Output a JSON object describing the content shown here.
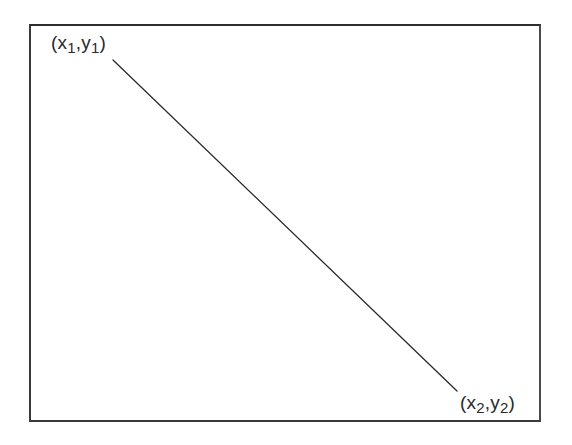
{
  "diagram": {
    "type": "line-segment",
    "frame": {
      "stroke": "#3a3a3a"
    },
    "line": {
      "stroke": "#2a2a2a",
      "start": {
        "x": 113,
        "y": 60
      },
      "end": {
        "x": 457,
        "y": 391
      }
    },
    "points": [
      {
        "id": "p1",
        "paren_open": "(",
        "x_var": "x",
        "x_sub": "1",
        "sep": ",",
        "y_var": "y",
        "y_sub": "1",
        "paren_close": ")"
      },
      {
        "id": "p2",
        "paren_open": "(",
        "x_var": "x",
        "x_sub": "2",
        "sep": ",",
        "y_var": "y",
        "y_sub": "2",
        "paren_close": ")"
      }
    ]
  }
}
